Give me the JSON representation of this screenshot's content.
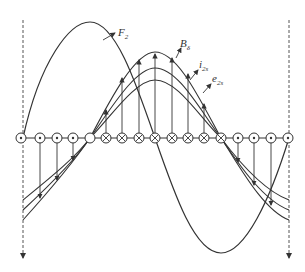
{
  "figure": {
    "labels": {
      "F2": {
        "main": "F",
        "sub": "2"
      },
      "B": {
        "main": "B",
        "sub": "δ"
      },
      "i": {
        "main": "i",
        "sub": "2s"
      },
      "e": {
        "main": "e",
        "sub": "2s"
      }
    },
    "conductor_row_y": 138,
    "conductors": [
      {
        "x": 21,
        "type": "dot"
      },
      {
        "x": 40,
        "type": "dot"
      },
      {
        "x": 57,
        "type": "dot"
      },
      {
        "x": 73,
        "type": "dot"
      },
      {
        "x": 90,
        "type": "empty"
      },
      {
        "x": 106,
        "type": "cross"
      },
      {
        "x": 122,
        "type": "cross"
      },
      {
        "x": 139,
        "type": "cross"
      },
      {
        "x": 155,
        "type": "cross"
      },
      {
        "x": 172,
        "type": "cross"
      },
      {
        "x": 188,
        "type": "cross"
      },
      {
        "x": 204,
        "type": "cross"
      },
      {
        "x": 221,
        "type": "cross"
      },
      {
        "x": 238,
        "type": "dot"
      },
      {
        "x": 254,
        "type": "dot"
      },
      {
        "x": 271,
        "type": "dot"
      },
      {
        "x": 288,
        "type": "dot"
      }
    ],
    "colors": {
      "stroke": "#333333",
      "background": "#ffffff"
    }
  }
}
